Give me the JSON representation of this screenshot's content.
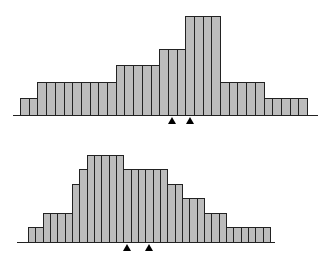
{
  "chart_data": [
    {
      "type": "bar",
      "title": "",
      "xlabel": "",
      "ylabel": "",
      "grid": false,
      "legend": null,
      "categories": [
        1,
        2,
        3,
        4,
        5,
        6,
        7,
        8,
        9,
        10,
        11,
        12,
        13,
        14,
        15,
        16,
        17,
        18,
        19,
        20,
        21,
        22,
        23,
        24,
        25,
        26,
        27,
        28,
        29,
        30,
        31,
        32,
        33
      ],
      "values": [
        1,
        1,
        2,
        2,
        2,
        2,
        2,
        2,
        2,
        2,
        2,
        3,
        3,
        3,
        3,
        3,
        4,
        4,
        4,
        6,
        6,
        6,
        6,
        2,
        2,
        2,
        2,
        2,
        1,
        1,
        1,
        1,
        1
      ],
      "markers": [
        18,
        20
      ],
      "layout": {
        "left": 20,
        "bar_width": 8.7,
        "axis_y": 115,
        "unit_px": 16.5,
        "axis_left": 13,
        "axis_right": 318
      }
    },
    {
      "type": "bar",
      "title": "",
      "xlabel": "",
      "ylabel": "",
      "grid": false,
      "legend": null,
      "categories": [
        1,
        2,
        3,
        4,
        5,
        6,
        7,
        8,
        9,
        10,
        11,
        12,
        13,
        14,
        15,
        16,
        17,
        18,
        19,
        20,
        21,
        22,
        23,
        24,
        25,
        26,
        27,
        28,
        29,
        30,
        31,
        32,
        33
      ],
      "values": [
        1,
        1,
        2,
        2,
        2,
        2,
        4,
        5,
        6,
        6,
        6,
        6,
        6,
        5,
        5,
        5,
        5,
        5,
        5,
        4,
        4,
        3,
        3,
        3,
        2,
        2,
        2,
        1,
        1,
        1,
        1,
        1,
        1
      ],
      "markers": [
        14,
        17
      ],
      "layout": {
        "left": 28,
        "bar_width": 7.33,
        "axis_y": 242,
        "unit_px": 14.5,
        "axis_left": 17,
        "axis_right": 275
      }
    }
  ]
}
